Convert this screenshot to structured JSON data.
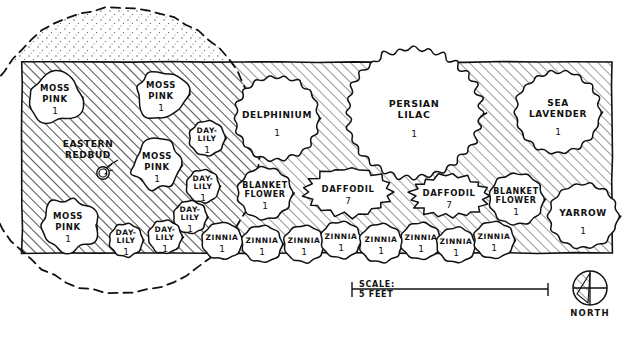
{
  "document": {
    "kind": "garden-planting-plan",
    "title": "Foundation Planting Plan"
  },
  "bed": {
    "left": 22,
    "top": 62,
    "right": 612,
    "bottom": 253
  },
  "canopy": {
    "label": "tree canopy drip line",
    "style": "dashed"
  },
  "plants": [
    {
      "id": "moss-pink-1",
      "label": "MOSS\nPINK",
      "lines": [
        "MOSS",
        "PINK"
      ],
      "qty": "1",
      "cx": 55,
      "cy": 97,
      "rx": 27,
      "ry": 25,
      "font": 8.5,
      "wobble": "blob",
      "shade": true
    },
    {
      "id": "moss-pink-2",
      "label": "MOSS\nPINK",
      "lines": [
        "MOSS",
        "PINK"
      ],
      "qty": "1",
      "cx": 161,
      "cy": 94,
      "rx": 27,
      "ry": 24,
      "font": 8.5,
      "wobble": "blob",
      "shade": true
    },
    {
      "id": "moss-pink-3",
      "label": "MOSS\nPINK",
      "lines": [
        "MOSS",
        "PINK"
      ],
      "qty": "1",
      "cx": 157,
      "cy": 165,
      "rx": 26,
      "ry": 24,
      "font": 8.5,
      "wobble": "blob",
      "shade": true
    },
    {
      "id": "moss-pink-4",
      "label": "MOSS\nPINK",
      "lines": [
        "MOSS",
        "PINK"
      ],
      "qty": "1",
      "cx": 68,
      "cy": 225,
      "rx": 28,
      "ry": 26,
      "font": 8.5,
      "wobble": "blob",
      "shade": true
    },
    {
      "id": "eastern-redbud",
      "label": "EASTERN\nREDBUD",
      "lines": [
        "EASTERN",
        "REDBUD"
      ],
      "qty": "",
      "cx": 88,
      "cy": 150,
      "rx": 0,
      "ry": 0,
      "font": 9,
      "wobble": "none",
      "shade": false
    },
    {
      "id": "day-lily-1",
      "label": "DAY-\nLILY",
      "lines": [
        "DAY-",
        "LILY"
      ],
      "qty": "1",
      "cx": 207,
      "cy": 138,
      "rx": 19,
      "ry": 19,
      "font": 7.5,
      "wobble": "scallop",
      "shade": true
    },
    {
      "id": "day-lily-2",
      "label": "DAY-\nLILY",
      "lines": [
        "DAY-",
        "LILY"
      ],
      "qty": "1",
      "cx": 203,
      "cy": 186,
      "rx": 18,
      "ry": 18,
      "font": 7.5,
      "wobble": "scallop",
      "shade": true
    },
    {
      "id": "day-lily-3",
      "label": "DAY-\nLILY",
      "lines": [
        "DAY-",
        "LILY"
      ],
      "qty": "1",
      "cx": 190,
      "cy": 217,
      "rx": 18,
      "ry": 18,
      "font": 7.5,
      "wobble": "scallop",
      "shade": true
    },
    {
      "id": "day-lily-4",
      "label": "DAY-\nLILY",
      "lines": [
        "DAY-",
        "LILY"
      ],
      "qty": "1",
      "cx": 165,
      "cy": 237,
      "rx": 18,
      "ry": 18,
      "font": 7.5,
      "wobble": "scallop",
      "shade": true
    },
    {
      "id": "day-lily-5",
      "label": "DAY-\nLILY",
      "lines": [
        "DAY-",
        "LILY"
      ],
      "qty": "1",
      "cx": 126,
      "cy": 240,
      "rx": 18,
      "ry": 18,
      "font": 7.5,
      "wobble": "scallop",
      "shade": true
    },
    {
      "id": "delphinium",
      "label": "DELPHINIUM",
      "lines": [
        "DELPHINIUM"
      ],
      "qty": "1",
      "cx": 277,
      "cy": 118,
      "rx": 45,
      "ry": 45,
      "font": 9,
      "wobble": "scallop",
      "shade": false
    },
    {
      "id": "persian-lilac",
      "label": "PERSIAN\nLILAC",
      "lines": [
        "PERSIAN",
        "LILAC"
      ],
      "qty": "1",
      "cx": 414,
      "cy": 113,
      "rx": 72,
      "ry": 69,
      "font": 9.5,
      "wobble": "scallop",
      "shade": false
    },
    {
      "id": "sea-lavender",
      "label": "SEA\nLAVENDER",
      "lines": [
        "SEA",
        "LAVENDER"
      ],
      "qty": "1",
      "cx": 558,
      "cy": 112,
      "rx": 45,
      "ry": 44,
      "font": 9,
      "wobble": "scallop",
      "shade": false
    },
    {
      "id": "blanket-flower-1",
      "label": "BLANKET\nFLOWER",
      "lines": [
        "BLANKET",
        "FLOWER"
      ],
      "qty": "1",
      "cx": 265,
      "cy": 193,
      "rx": 29,
      "ry": 28,
      "font": 8,
      "wobble": "scallop",
      "shade": false
    },
    {
      "id": "daffodil-1",
      "label": "DAFFODIL",
      "lines": [
        "DAFFODIL"
      ],
      "qty": "7",
      "cx": 348,
      "cy": 192,
      "rx": 46,
      "ry": 25,
      "font": 8.5,
      "wobble": "drift",
      "shade": false
    },
    {
      "id": "daffodil-2",
      "label": "DAFFODIL",
      "lines": [
        "DAFFODIL"
      ],
      "qty": "7",
      "cx": 449,
      "cy": 196,
      "rx": 40,
      "ry": 22,
      "font": 8.5,
      "wobble": "drift",
      "shade": false
    },
    {
      "id": "blanket-flower-2",
      "label": "BLANKET\nFLOWER",
      "lines": [
        "BLANKET",
        "FLOWER"
      ],
      "qty": "1",
      "cx": 516,
      "cy": 199,
      "rx": 29,
      "ry": 28,
      "font": 8,
      "wobble": "scallop",
      "shade": false
    },
    {
      "id": "yarrow",
      "label": "YARROW",
      "lines": [
        "YARROW"
      ],
      "qty": "1",
      "cx": 583,
      "cy": 216,
      "rx": 37,
      "ry": 35,
      "font": 9,
      "wobble": "scallop",
      "shade": false
    },
    {
      "id": "zinnia-1",
      "label": "ZINNIA",
      "lines": [
        "ZINNIA"
      ],
      "qty": "1",
      "cx": 222,
      "cy": 241,
      "rx": 22,
      "ry": 20,
      "font": 7.5,
      "wobble": "scallop",
      "shade": false
    },
    {
      "id": "zinnia-2",
      "label": "ZINNIA",
      "lines": [
        "ZINNIA"
      ],
      "qty": "1",
      "cx": 262,
      "cy": 244,
      "rx": 22,
      "ry": 20,
      "font": 7.5,
      "wobble": "scallop",
      "shade": false
    },
    {
      "id": "zinnia-3",
      "label": "ZINNIA",
      "lines": [
        "ZINNIA"
      ],
      "qty": "1",
      "cx": 304,
      "cy": 244,
      "rx": 22,
      "ry": 20,
      "font": 7.5,
      "wobble": "scallop",
      "shade": false
    },
    {
      "id": "zinnia-4",
      "label": "ZINNIA",
      "lines": [
        "ZINNIA"
      ],
      "qty": "1",
      "cx": 341,
      "cy": 240,
      "rx": 22,
      "ry": 20,
      "font": 7.5,
      "wobble": "scallop",
      "shade": false
    },
    {
      "id": "zinnia-5",
      "label": "ZINNIA",
      "lines": [
        "ZINNIA"
      ],
      "qty": "1",
      "cx": 381,
      "cy": 243,
      "rx": 23,
      "ry": 21,
      "font": 7.5,
      "wobble": "scallop",
      "shade": false
    },
    {
      "id": "zinnia-6",
      "label": "ZINNIA",
      "lines": [
        "ZINNIA"
      ],
      "qty": "1",
      "cx": 421,
      "cy": 241,
      "rx": 22,
      "ry": 20,
      "font": 7.5,
      "wobble": "scallop",
      "shade": false
    },
    {
      "id": "zinnia-7",
      "label": "ZINNIA",
      "lines": [
        "ZINNIA"
      ],
      "qty": "1",
      "cx": 456,
      "cy": 245,
      "rx": 21,
      "ry": 19,
      "font": 7.5,
      "wobble": "scallop",
      "shade": false
    },
    {
      "id": "zinnia-8",
      "label": "ZINNIA",
      "lines": [
        "ZINNIA"
      ],
      "qty": "1",
      "cx": 494,
      "cy": 240,
      "rx": 22,
      "ry": 20,
      "font": 7.5,
      "wobble": "scallop",
      "shade": false
    }
  ],
  "scale_bar": {
    "label_line1": "SCALE:",
    "label_line2": "5 FEET",
    "x1": 352,
    "x2": 548,
    "y": 291
  },
  "compass": {
    "label": "NORTH",
    "cx": 590,
    "cy": 288,
    "r": 17
  },
  "colors": {
    "ink": "#111111",
    "paper": "#ffffff",
    "hatch": "#3a3a3a"
  }
}
